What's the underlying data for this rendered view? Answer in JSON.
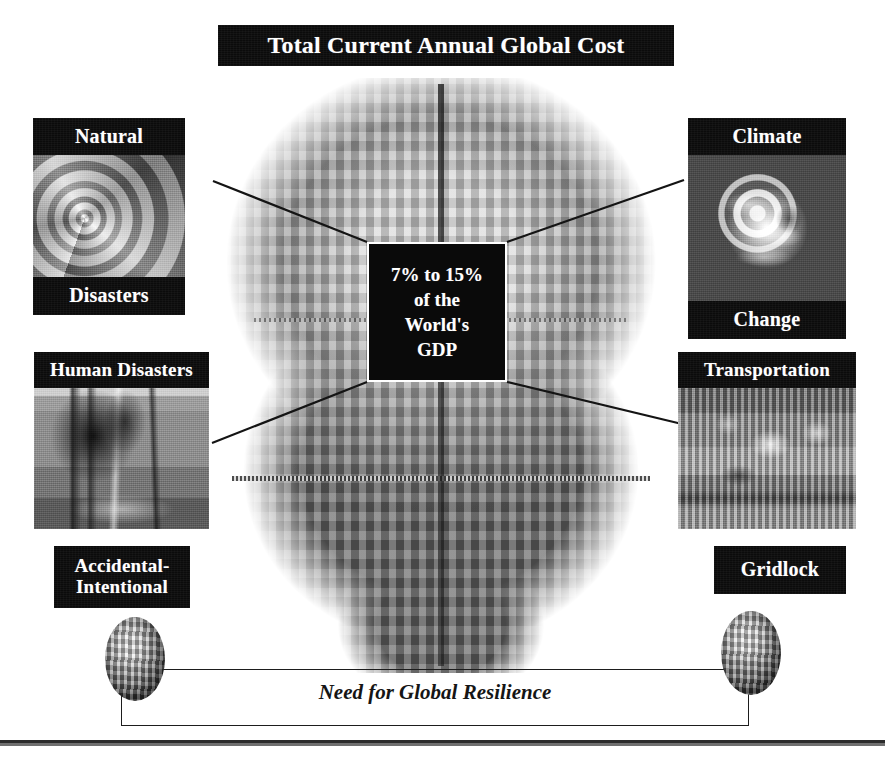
{
  "title": {
    "text": "Total Current Annual Global Cost"
  },
  "center": {
    "line1": "7% to 15%",
    "line2": "of the",
    "line3": "World's",
    "line4": "GDP"
  },
  "quadrants": [
    {
      "id": "natural-disasters",
      "position": "top-left",
      "top_label": "Natural",
      "bottom_label": "Disasters",
      "image": "hurricane-satellite-image"
    },
    {
      "id": "climate-change",
      "position": "top-right",
      "top_label": "Climate",
      "bottom_label": "Change",
      "image": "earth-globe-image"
    },
    {
      "id": "human-disasters",
      "position": "bottom-left",
      "top_label": "Human Disasters",
      "bottom_label": "Accidental-\nIntentional",
      "bottom_label_line1": "Accidental-",
      "bottom_label_line2": "Intentional",
      "image": "industrial-fire-image"
    },
    {
      "id": "transportation",
      "position": "bottom-right",
      "top_label": "Transportation",
      "bottom_label": "Gridlock",
      "image": "traffic-jam-image"
    }
  ],
  "footer": {
    "caption": "Need for Global Resilience"
  },
  "graphics": {
    "center_image": "globe-of-city-buildings",
    "left_mini_globe": "mini-globe-icon",
    "right_mini_globe": "mini-globe-icon"
  },
  "colors": {
    "band_background": "#0b0b0b",
    "band_text": "#ffffff",
    "page_background": "#ffffff",
    "line": "#1d1d1d",
    "rule": "#2b2b2b"
  }
}
